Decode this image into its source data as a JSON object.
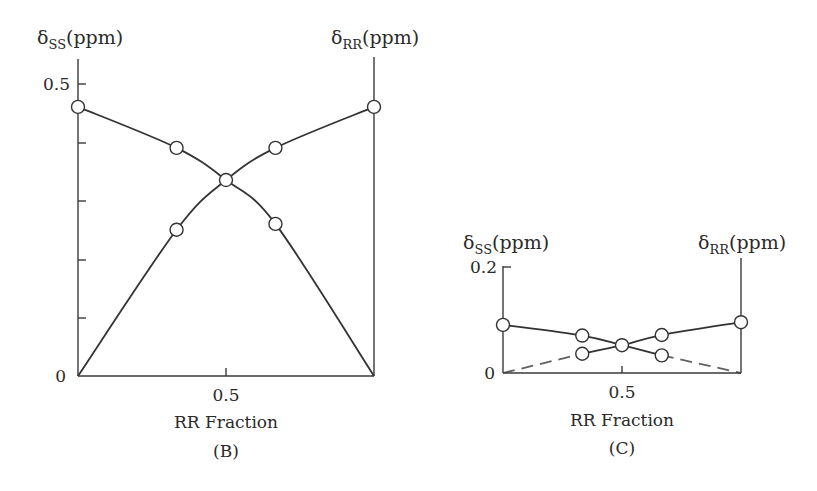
{
  "figure": {
    "panels": [
      "B",
      "C"
    ]
  },
  "chart_data": [
    {
      "type": "line",
      "panel_label": "(B)",
      "title": "",
      "xlabel": "RR Fraction",
      "ylabel_left": "δSS(ppm)",
      "ylabel_right": "δRR(ppm)",
      "ylabel_left_main": "δ",
      "ylabel_left_sub": "SS",
      "ylabel_left_unit": "(ppm)",
      "ylabel_right_main": "δ",
      "ylabel_right_sub": "RR",
      "ylabel_right_unit": "(ppm)",
      "xlim": [
        0,
        1
      ],
      "ylim": [
        0,
        0.5
      ],
      "x_ticks": [
        0.5
      ],
      "x_tick_labels": [
        "0.5"
      ],
      "y_ticks": [
        0,
        0.1,
        0.2,
        0.3,
        0.4,
        0.5
      ],
      "y_tick_labels": [
        "0",
        "",
        "",
        "",
        "",
        "0.5"
      ],
      "grid": false,
      "legend": null,
      "x": [
        0,
        0.333,
        0.5,
        0.667,
        1
      ],
      "series": [
        {
          "name": "δSS",
          "values": [
            0.46,
            0.39,
            0.335,
            0.26,
            0
          ],
          "markers_at": [
            0,
            0.333,
            0.5,
            0.667
          ]
        },
        {
          "name": "δRR",
          "values": [
            0,
            0.25,
            0.335,
            0.39,
            0.46
          ],
          "markers_at": [
            0.333,
            0.5,
            0.667,
            1
          ]
        }
      ]
    },
    {
      "type": "line",
      "panel_label": "(C)",
      "title": "",
      "xlabel": "RR Fraction",
      "ylabel_left": "δSS(ppm)",
      "ylabel_right": "δRR(ppm)",
      "ylabel_left_main": "δ",
      "ylabel_left_sub": "SS",
      "ylabel_left_unit": "(ppm)",
      "ylabel_right_main": "δ",
      "ylabel_right_sub": "RR",
      "ylabel_right_unit": "(ppm)",
      "xlim": [
        0,
        1
      ],
      "ylim": [
        0,
        0.2
      ],
      "x_ticks": [
        0.5
      ],
      "x_tick_labels": [
        "0.5"
      ],
      "y_ticks": [
        0,
        0.2
      ],
      "y_tick_labels": [
        "0",
        "0.2"
      ],
      "grid": false,
      "legend": null,
      "x": [
        0,
        0.333,
        0.5,
        0.667,
        1
      ],
      "series": [
        {
          "name": "δSS",
          "values": [
            0.09,
            0.07,
            0.052,
            0.033,
            0
          ],
          "markers_at": [
            0,
            0.333,
            0.5,
            0.667
          ]
        },
        {
          "name": "δRR",
          "values": [
            0,
            0.036,
            0.052,
            0.071,
            0.095
          ],
          "markers_at": [
            0.333,
            0.5,
            0.667,
            1
          ]
        }
      ]
    }
  ]
}
